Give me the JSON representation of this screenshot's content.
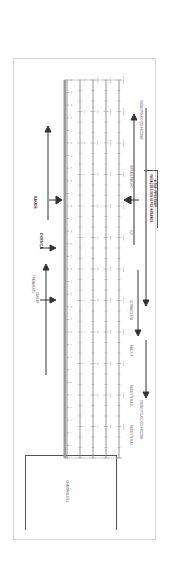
{
  "diagram": {
    "orientation": "rotated-90-clockwise",
    "boxed_note": {
      "line1": "A SEA: INVESTIGAR",
      "line2": "RADIAÇÕES DOS SERES HUMANOS"
    },
    "witness_box": {
      "label": "TESTEMUNHO"
    },
    "top_labels": [
      {
        "id": "ondas-pouco-conhecidas-1",
        "text": "ONDAS POUCO CONHECIDAS"
      },
      {
        "id": "ondas-pouco-conhecidas-2",
        "text": "ONDAS POUCO CONHECIDAS"
      },
      {
        "id": "radiestesia-l",
        "text": "RADIESTESIA L"
      },
      {
        "id": "radiestesia-d",
        "text": "RADIESTESIA D"
      },
      {
        "id": "infravermelho",
        "text": "INFRAVERMELHO"
      },
      {
        "id": "luz",
        "text": "LUZ"
      },
      {
        "id": "ultravioleta",
        "text": "ULTRAVIOLETA"
      },
      {
        "id": "raios-x",
        "text": "RAIOS X"
      },
      {
        "id": "raios-gama",
        "text": "RAIOS GAMA"
      },
      {
        "id": "raios-cosmicos",
        "text": "RAIOS CÓSMICOS"
      }
    ],
    "scale_rows": [
      {
        "id": "row1",
        "values": [
          "1.000",
          "2.000",
          "3.000",
          "4.000",
          "5.000",
          "6.000",
          "7.000",
          "8.000",
          "9.000",
          "10.000",
          "11.000",
          "12.000"
        ]
      },
      {
        "id": "row2",
        "values": [
          "100",
          "200",
          "300",
          "400",
          "500",
          "600",
          "700",
          "800",
          "900",
          "1.000",
          "1.100",
          "1.200"
        ]
      },
      {
        "id": "row3",
        "values": [
          "10",
          "20",
          "30",
          "40",
          "50",
          "60",
          "70",
          "80",
          "90",
          "100",
          "110",
          "120"
        ]
      },
      {
        "id": "row4",
        "values": [
          "1",
          "2",
          "3",
          "4",
          "5",
          "6",
          "7",
          "8",
          "9",
          "10",
          "11",
          "12"
        ]
      },
      {
        "id": "row5",
        "values": [
          "1",
          "2",
          "3",
          "4",
          "5",
          "6",
          "7",
          "8",
          "9",
          "10",
          "11",
          "12",
          "13",
          "14",
          "15",
          "16",
          "17",
          "18",
          "19",
          "20",
          "21",
          "22",
          "23",
          "24",
          "25",
          "26",
          "27",
          "28",
          "29",
          "30"
        ]
      }
    ],
    "row_inline_labels": [
      {
        "row": "row4",
        "text": "INFRAVERMELHO",
        "at": 9
      },
      {
        "row": "row4",
        "text": "ULTRAVIOLETA",
        "at": 5
      },
      {
        "row": "row4",
        "text": "ULTRAVIOLETA",
        "at": 3
      }
    ],
    "bottom_labels": {
      "doenca": "DOENÇA",
      "saude": "SAÚDE",
      "cancer": "CÂNCER",
      "tratamento": "TRATAMENTO"
    }
  }
}
